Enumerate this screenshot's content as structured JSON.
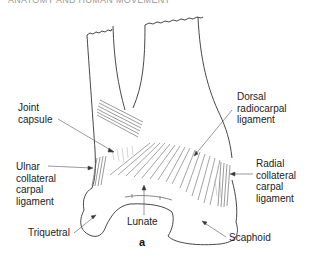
{
  "header": {
    "title": "ANATOMY AND HUMAN MOVEMENT"
  },
  "figure": {
    "letter": "a",
    "labels": {
      "joint_capsule": [
        "Joint",
        "capsule"
      ],
      "ulnar_collateral": [
        "Ulnar",
        "collateral",
        "carpal",
        "ligament"
      ],
      "triquetral": "Triquetral",
      "lunate": "Lunate",
      "dorsal_radiocarpal": [
        "Dorsal",
        "radiocarpal",
        "ligament"
      ],
      "radial_collateral": [
        "Radial",
        "collateral",
        "carpal",
        "ligament"
      ],
      "scaphoid": "Scaphoid"
    }
  }
}
